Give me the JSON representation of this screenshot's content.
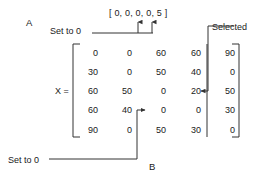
{
  "figure": {
    "panel_a_label": "A",
    "panel_b_label": "B",
    "matrix_name": "X =",
    "vector_label": "[ 0, 0, 0, 0, 5 ]",
    "selected_label": "Selected",
    "set_to_zero_top_label": "Set to 0",
    "set_to_zero_bottom_label": "Set to 0",
    "line_color": "#333333",
    "text_color": "#1a1a1a",
    "background_color": "#ffffff"
  },
  "matrix": {
    "rows": 5,
    "cols": 5,
    "selected_column_index": 4,
    "values": [
      [
        "0",
        "0",
        "60",
        "60",
        "90"
      ],
      [
        "30",
        "0",
        "50",
        "40",
        "0"
      ],
      [
        "60",
        "50",
        "0",
        "20",
        "50"
      ],
      [
        "60",
        "40",
        "0",
        "0",
        "30"
      ],
      [
        "90",
        "0",
        "50",
        "30",
        "0"
      ]
    ]
  },
  "annotations": {
    "set_to_zero_top_targets": "columns 3 and 4 of vector",
    "set_to_zero_bottom_target": "row 4 column 3 value 0",
    "selected_target": "row 3 column 4 value 20"
  }
}
